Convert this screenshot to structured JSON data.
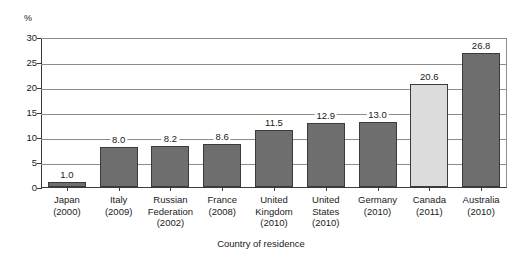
{
  "chart_data": {
    "type": "bar",
    "title": "",
    "xlabel": "Country of residence",
    "ylabel": "%",
    "ylim": [
      0,
      30
    ],
    "yticks": [
      0,
      5,
      10,
      15,
      20,
      25,
      30
    ],
    "grid": true,
    "legend": "none",
    "categories": [
      "Japan",
      "Italy",
      "Russian Federation",
      "France",
      "United Kingdom",
      "United States",
      "Germany",
      "Canada",
      "Australia"
    ],
    "category_years": [
      "(2000)",
      "(2009)",
      "(2002)",
      "(2008)",
      "(2010)",
      "(2010)",
      "(2010)",
      "(2011)",
      "(2010)"
    ],
    "category_lines": [
      [
        "Japan"
      ],
      [
        "Italy"
      ],
      [
        "Russian",
        "Federation"
      ],
      [
        "France"
      ],
      [
        "United",
        "Kingdom"
      ],
      [
        "United",
        "States"
      ],
      [
        "Germany"
      ],
      [
        "Canada"
      ],
      [
        "Australia"
      ]
    ],
    "values": [
      1.0,
      8.0,
      8.2,
      8.6,
      11.5,
      12.9,
      13.0,
      20.6,
      26.8
    ],
    "value_labels": [
      "1.0",
      "8.0",
      "8.2",
      "8.6",
      "11.5",
      "12.9",
      "13.0",
      "20.6",
      "26.8"
    ],
    "bar_colors": [
      "#6e6e6e",
      "#6e6e6e",
      "#6e6e6e",
      "#6e6e6e",
      "#6e6e6e",
      "#6e6e6e",
      "#6e6e6e",
      "#dcdcdc",
      "#6e6e6e"
    ],
    "highlight_category": "Canada",
    "colors": {
      "bar_default": "#6e6e6e",
      "bar_highlight": "#dcdcdc",
      "bar_outline": "#3b3b3b",
      "gridline": "#8c8c8c",
      "axis": "#3a3a3a",
      "text": "#1a1a1a",
      "background": "#ffffff"
    }
  }
}
